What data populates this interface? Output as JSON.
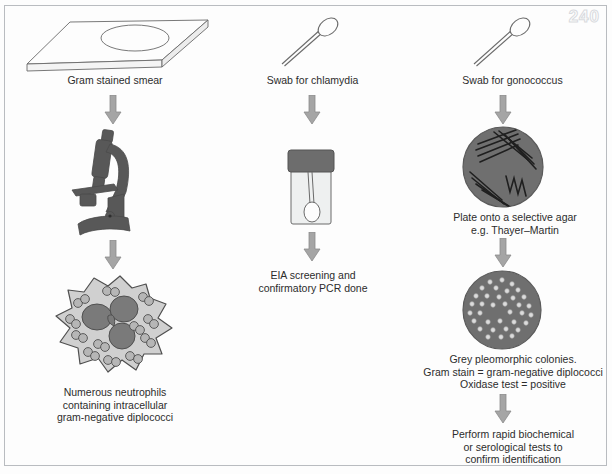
{
  "page": {
    "number": "240",
    "background": "#fdfdfd",
    "frame_color": "#b9bcc0"
  },
  "palette": {
    "arrow_gray": "#9b9b9b",
    "arrow_gray_dark": "#8a8a8a",
    "outline": "#5a5a5a",
    "dark_fill": "#5d5d5d",
    "mid_fill": "#7c7c7c",
    "light_fill": "#d2d2d2",
    "text": "#2c2c2c",
    "page_number_color": "#d8dade"
  },
  "columns": [
    {
      "id": "gram-stain",
      "steps": [
        {
          "id": "slide",
          "icon": "microscope-slide-icon",
          "caption": "Gram stained smear"
        },
        {
          "id": "arrow-1",
          "icon": "down-arrow-icon",
          "caption": ""
        },
        {
          "id": "microscope",
          "icon": "microscope-icon",
          "caption": ""
        },
        {
          "id": "arrow-2",
          "icon": "down-arrow-icon",
          "caption": ""
        },
        {
          "id": "neutrophil",
          "icon": "neutrophil-cell-icon",
          "caption": "Numerous neutrophils\ncontaining intracellular\ngram-negative diplococci"
        }
      ]
    },
    {
      "id": "chlamydia",
      "steps": [
        {
          "id": "swab",
          "icon": "cotton-swab-icon",
          "caption": "Swab for chlamydia"
        },
        {
          "id": "arrow-1",
          "icon": "down-arrow-icon",
          "caption": ""
        },
        {
          "id": "tube",
          "icon": "specimen-tube-icon",
          "caption": ""
        },
        {
          "id": "arrow-2",
          "icon": "down-arrow-icon",
          "caption": ""
        },
        {
          "id": "result",
          "icon": "",
          "caption": "EIA screening and\nconfirmatory PCR done"
        }
      ]
    },
    {
      "id": "gonococcus",
      "steps": [
        {
          "id": "swab",
          "icon": "cotton-swab-icon",
          "caption": "Swab for gonococcus"
        },
        {
          "id": "arrow-1",
          "icon": "down-arrow-icon",
          "caption": ""
        },
        {
          "id": "streak-plate",
          "icon": "streaked-agar-plate-icon",
          "caption": "Plate onto a selective agar\ne.g. Thayer–Martin"
        },
        {
          "id": "arrow-2",
          "icon": "down-arrow-icon",
          "caption": ""
        },
        {
          "id": "colony-plate",
          "icon": "colony-agar-plate-icon",
          "caption": "Grey pleomorphic colonies.\nGram stain = gram-negative diplococci\nOxidase test = positive"
        },
        {
          "id": "arrow-3",
          "icon": "down-arrow-icon",
          "caption": ""
        },
        {
          "id": "final",
          "icon": "",
          "caption": "Perform rapid biochemical\nor serological tests to\nconfirm identification"
        }
      ]
    }
  ]
}
